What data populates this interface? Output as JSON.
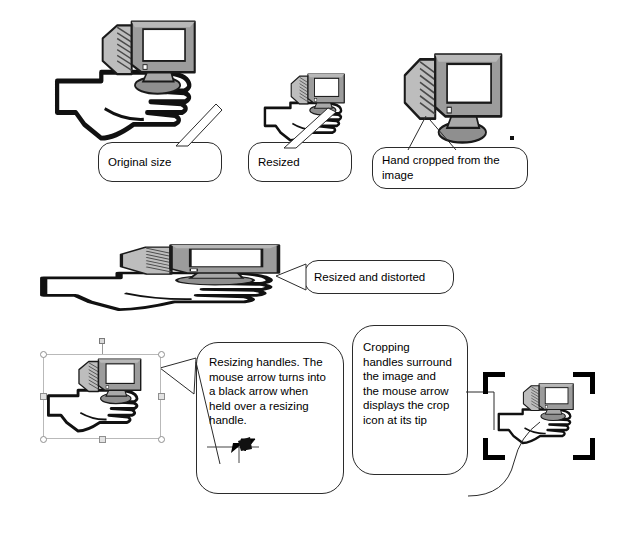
{
  "page": {
    "background": "#ffffff",
    "width": 624,
    "height": 533
  },
  "colors": {
    "ink": "#000000",
    "outline": "#2b2b2b",
    "monitor_body": "#999999",
    "monitor_body_light": "#b5b5b5",
    "monitor_shade": "#6e6e6e",
    "screen": "#ffffff",
    "handle_border": "#8f8f8f",
    "handle_fill": "#e2e2e2",
    "selection_border": "#b9b9b9",
    "crop_bracket": "#000000"
  },
  "figures": [
    {
      "id": "original",
      "name": "hand-holding-monitor-original",
      "kind": "hand-and-monitor",
      "state": "original size",
      "x": 52,
      "y": 18,
      "width": 170,
      "height": 130,
      "scale_x": 1.0,
      "scale_y": 1.0
    },
    {
      "id": "resized",
      "name": "hand-holding-monitor-resized",
      "kind": "hand-and-monitor",
      "state": "resized smaller",
      "x": 262,
      "y": 72,
      "width": 98,
      "height": 74,
      "scale_x": 0.58,
      "scale_y": 0.58
    },
    {
      "id": "cropped",
      "name": "monitor-only-cropped",
      "kind": "monitor-only",
      "state": "hand cropped away",
      "x": 398,
      "y": 48,
      "width": 110,
      "height": 98
    },
    {
      "id": "distorted",
      "name": "hand-holding-monitor-distorted",
      "kind": "hand-and-monitor",
      "state": "resized and distorted",
      "x": 35,
      "y": 243,
      "width": 290,
      "height": 72,
      "scale_x": 1.72,
      "scale_y": 0.58
    },
    {
      "id": "selected",
      "name": "hand-holding-monitor-selected",
      "kind": "hand-and-monitor",
      "state": "selected with resizing handles",
      "x": 45,
      "y": 357,
      "width": 114,
      "height": 80
    },
    {
      "id": "cropping",
      "name": "hand-holding-monitor-cropping",
      "kind": "hand-and-monitor",
      "state": "crop handles shown",
      "x": 496,
      "y": 382,
      "width": 92,
      "height": 66
    }
  ],
  "callouts": [
    {
      "id": "c-original",
      "name": "callout-original-size",
      "text": "Original size",
      "x": 98,
      "y": 142,
      "width": 124,
      "height": 40,
      "tail": "up-right"
    },
    {
      "id": "c-resized",
      "name": "callout-resized",
      "text": "Resized",
      "x": 248,
      "y": 142,
      "width": 104,
      "height": 40,
      "tail": "up-right"
    },
    {
      "id": "c-cropped",
      "name": "callout-hand-cropped",
      "text": "Hand cropped from the\nimage",
      "x": 372,
      "y": 147,
      "width": 156,
      "height": 42,
      "tail": "up-two-lines"
    },
    {
      "id": "c-distorted",
      "name": "callout-resized-and-distorted",
      "text": "Resized and distorted",
      "x": 304,
      "y": 260,
      "width": 150,
      "height": 34,
      "tail": "left"
    },
    {
      "id": "c-resizing",
      "name": "callout-resizing-handles",
      "text": "Resizing handles.  The\nmouse arrow turns into\na black arrow when\nheld over a resizing\nhandle.",
      "x": 196,
      "y": 342,
      "width": 148,
      "height": 152,
      "tail": "left-up",
      "icon": "resize-arrow-icon"
    },
    {
      "id": "c-cropping",
      "name": "callout-cropping-handles",
      "text": "Cropping\nhandles surround\nthe image and\nthe mouse arrow\ndisplays the crop\nicon at its tip",
      "x": 352,
      "y": 325,
      "width": 116,
      "height": 150,
      "tail": "right-and-curve"
    }
  ],
  "selection": {
    "name": "resize-selection-box",
    "x": 43,
    "y": 354,
    "width": 118,
    "height": 85,
    "handles": [
      {
        "name": "handle-top-left",
        "type": "circle",
        "pos": "tl"
      },
      {
        "name": "handle-top-right",
        "type": "circle",
        "pos": "tr"
      },
      {
        "name": "handle-bottom-left",
        "type": "circle",
        "pos": "bl"
      },
      {
        "name": "handle-bottom-right",
        "type": "circle",
        "pos": "br"
      },
      {
        "name": "handle-middle-left",
        "type": "square",
        "pos": "ml"
      },
      {
        "name": "handle-middle-right",
        "type": "square",
        "pos": "mr"
      },
      {
        "name": "handle-bottom-center",
        "type": "square",
        "pos": "bc"
      },
      {
        "name": "handle-rotate",
        "type": "rotate",
        "pos": "top"
      }
    ]
  },
  "crop": {
    "name": "crop-bracket-frame",
    "x": 483,
    "y": 372,
    "width": 112,
    "height": 88,
    "corners": [
      "top-left",
      "top-right",
      "bottom-left",
      "bottom-right"
    ],
    "arm_length": 22,
    "thickness": 5
  },
  "icons": {
    "resize_arrow": {
      "name": "resize-arrow-icon",
      "description": "horizontal line with black double arrow cursor"
    },
    "crop_cursor": {
      "name": "crop-cursor-icon",
      "description": "pointer with crop icon at tip"
    }
  }
}
